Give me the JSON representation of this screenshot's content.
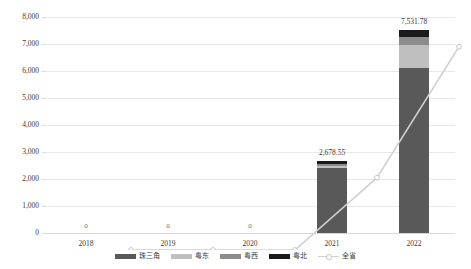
{
  "chart_data": {
    "type": "bar",
    "title": "",
    "subtitle": "",
    "xlabel": "",
    "ylabel": "",
    "ylim": [
      0,
      8000
    ],
    "ytick_step": 1000,
    "ytick_labels": [
      "8,000",
      "7,000",
      "6,000",
      "5,000",
      "4,000",
      "3,000",
      "2,000",
      "1,000",
      "0"
    ],
    "ytick_values": [
      8000,
      7000,
      6000,
      5000,
      4000,
      3000,
      2000,
      1000,
      0
    ],
    "grid": true,
    "stacked": true,
    "legend_position": "bottom",
    "categories": [
      "2018",
      "2019",
      "2020",
      "2021",
      "2022"
    ],
    "series": [
      {
        "name": "珠三角",
        "type": "bar",
        "color": "#595959",
        "values": [
          0,
          0,
          0,
          2410.0,
          6120.0
        ]
      },
      {
        "name": "粤东",
        "type": "bar",
        "color": "#bfbfbf",
        "values": [
          0,
          0,
          0,
          88.0,
          830.0
        ]
      },
      {
        "name": "粤西",
        "type": "bar",
        "color": "#8c8c8c",
        "values": [
          0,
          0,
          0,
          50.0,
          300.0
        ]
      },
      {
        "name": "粤北",
        "type": "bar",
        "color": "#1a1a1a",
        "values": [
          0,
          0,
          0,
          130.55,
          281.78
        ]
      },
      {
        "name": "全省",
        "type": "line",
        "color": "#d0d0d0",
        "values": [
          0,
          0,
          0,
          2678.55,
          7531.78
        ]
      }
    ],
    "data_labels": [
      {
        "category": "2018",
        "text": "0"
      },
      {
        "category": "2019",
        "text": "0"
      },
      {
        "category": "2020",
        "text": "0"
      },
      {
        "category": "2021",
        "text": "2,678.55"
      },
      {
        "category": "2022",
        "text": "7,531.78"
      }
    ]
  },
  "legend": {
    "items": [
      {
        "label": "珠三角",
        "color": "#595959",
        "kind": "swatch"
      },
      {
        "label": "粤东",
        "color": "#bfbfbf",
        "kind": "swatch"
      },
      {
        "label": "粤西",
        "color": "#8c8c8c",
        "kind": "swatch"
      },
      {
        "label": "粤北",
        "color": "#1a1a1a",
        "kind": "swatch"
      },
      {
        "label": "全省",
        "color": "#d0d0d0",
        "kind": "line"
      }
    ]
  },
  "colors": {
    "grid": "#e8e8e8",
    "axis": "#d9d9d9",
    "text": "#3a3a3a",
    "background": "#ffffff"
  }
}
